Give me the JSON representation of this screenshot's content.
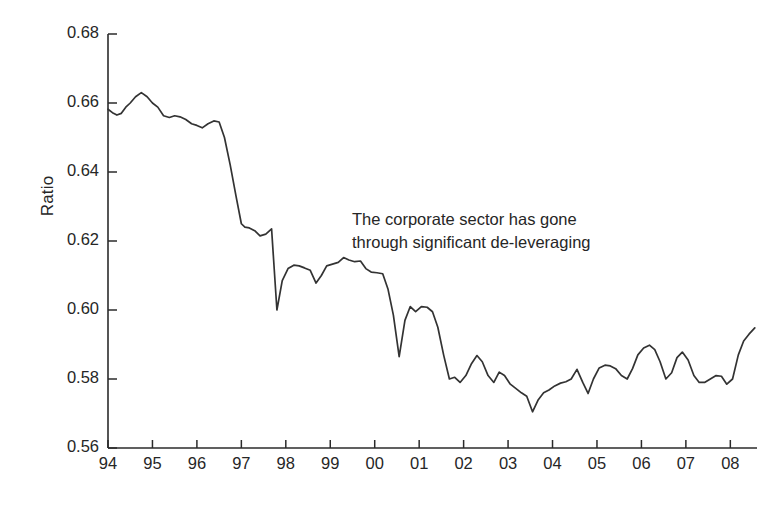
{
  "chart_data": {
    "type": "line",
    "title": "",
    "subtitle": "",
    "xlabel": "",
    "ylabel": "Ratio",
    "ylim": [
      0.56,
      0.68
    ],
    "xlim": [
      1994.0,
      2008.6
    ],
    "grid": false,
    "legend": null,
    "yticks": [
      "0.56",
      "0.58",
      "0.60",
      "0.62",
      "0.64",
      "0.66",
      "0.68"
    ],
    "ytick_values": [
      0.56,
      0.58,
      0.6,
      0.62,
      0.64,
      0.66,
      0.68
    ],
    "xticks": [
      "94",
      "95",
      "96",
      "97",
      "98",
      "99",
      "00",
      "01",
      "02",
      "03",
      "04",
      "05",
      "06",
      "07",
      "08"
    ],
    "xtick_values": [
      1994,
      1995,
      1996,
      1997,
      1998,
      1999,
      2000,
      2001,
      2002,
      2003,
      2004,
      2005,
      2006,
      2007,
      2008
    ],
    "annotations": [
      {
        "text": "The corporate sector has gone\nthrough significant de-leveraging",
        "x": 1999.1,
        "y": 0.6245
      }
    ],
    "series": [
      {
        "name": "Ratio",
        "color": "#333333",
        "x": [
          1994.0,
          1994.1,
          1994.2,
          1994.3,
          1994.4,
          1994.5,
          1994.62,
          1994.75,
          1994.88,
          1995.0,
          1995.12,
          1995.25,
          1995.38,
          1995.5,
          1995.62,
          1995.75,
          1995.88,
          1996.0,
          1996.12,
          1996.25,
          1996.38,
          1996.5,
          1996.62,
          1996.75,
          1996.88,
          1997.0,
          1997.08,
          1997.18,
          1997.3,
          1997.42,
          1997.55,
          1997.68,
          1997.8,
          1997.92,
          1998.05,
          1998.18,
          1998.3,
          1998.42,
          1998.55,
          1998.68,
          1998.8,
          1998.92,
          1999.05,
          1999.18,
          1999.3,
          1999.42,
          1999.55,
          1999.68,
          1999.8,
          1999.92,
          2000.05,
          2000.18,
          2000.3,
          2000.42,
          2000.55,
          2000.68,
          2000.8,
          2000.92,
          2001.05,
          2001.18,
          2001.3,
          2001.42,
          2001.55,
          2001.68,
          2001.8,
          2001.92,
          2002.05,
          2002.18,
          2002.3,
          2002.42,
          2002.55,
          2002.68,
          2002.8,
          2002.92,
          2003.05,
          2003.18,
          2003.3,
          2003.42,
          2003.55,
          2003.68,
          2003.8,
          2003.92,
          2004.05,
          2004.18,
          2004.3,
          2004.42,
          2004.55,
          2004.68,
          2004.8,
          2004.92,
          2005.05,
          2005.18,
          2005.3,
          2005.42,
          2005.55,
          2005.68,
          2005.8,
          2005.92,
          2006.05,
          2006.18,
          2006.3,
          2006.42,
          2006.55,
          2006.68,
          2006.8,
          2006.92,
          2007.05,
          2007.18,
          2007.3,
          2007.42,
          2007.55,
          2007.68,
          2007.8,
          2007.92,
          2008.05,
          2008.18,
          2008.3,
          2008.42,
          2008.55
        ],
        "y": [
          0.6582,
          0.6572,
          0.6565,
          0.657,
          0.6588,
          0.66,
          0.6618,
          0.663,
          0.6618,
          0.66,
          0.6588,
          0.6563,
          0.6558,
          0.6563,
          0.656,
          0.6552,
          0.654,
          0.6535,
          0.6528,
          0.654,
          0.6548,
          0.6545,
          0.65,
          0.642,
          0.633,
          0.625,
          0.624,
          0.6238,
          0.623,
          0.6215,
          0.622,
          0.6235,
          0.6,
          0.6085,
          0.612,
          0.613,
          0.6128,
          0.6122,
          0.6115,
          0.6078,
          0.61,
          0.6128,
          0.6133,
          0.6138,
          0.6152,
          0.6145,
          0.614,
          0.6142,
          0.612,
          0.611,
          0.6108,
          0.6105,
          0.606,
          0.5985,
          0.5865,
          0.597,
          0.601,
          0.5995,
          0.601,
          0.6008,
          0.5995,
          0.595,
          0.587,
          0.58,
          0.5805,
          0.579,
          0.581,
          0.5845,
          0.5868,
          0.585,
          0.581,
          0.579,
          0.582,
          0.581,
          0.5785,
          0.5772,
          0.576,
          0.575,
          0.5705,
          0.574,
          0.576,
          0.5768,
          0.578,
          0.5788,
          0.5792,
          0.58,
          0.5828,
          0.579,
          0.5758,
          0.58,
          0.5832,
          0.584,
          0.5838,
          0.583,
          0.581,
          0.58,
          0.583,
          0.587,
          0.589,
          0.5898,
          0.5885,
          0.585,
          0.58,
          0.5818,
          0.5862,
          0.5878,
          0.5855,
          0.581,
          0.579,
          0.579,
          0.58,
          0.581,
          0.5808,
          0.5785,
          0.58,
          0.587,
          0.591,
          0.593,
          0.5948
        ]
      }
    ]
  },
  "axis": {
    "ylabel": "Ratio"
  }
}
